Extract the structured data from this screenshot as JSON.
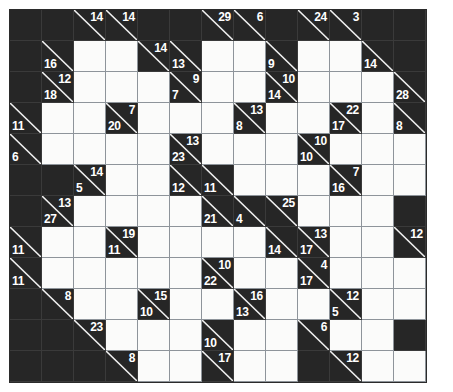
{
  "puzzle": {
    "type": "kakuro",
    "title": "Kakuro",
    "columns": 13,
    "rows": 12,
    "cell_size_px": 32,
    "colors": {
      "block": "#262626",
      "open": "#fbfbfa",
      "clue_text": "#ffffff",
      "slash": "#f2f2f2",
      "grid_line": "#8e949a",
      "page_background": "#ffffff"
    },
    "legend": {
      "down_position": "top-right",
      "across_position": "bottom-left"
    },
    "cells": [
      [
        {
          "t": "block"
        },
        {
          "t": "block"
        },
        {
          "t": "clue",
          "down": 14
        },
        {
          "t": "clue",
          "down": 14
        },
        {
          "t": "block"
        },
        {
          "t": "block"
        },
        {
          "t": "clue",
          "down": 29
        },
        {
          "t": "clue",
          "down": 6
        },
        {
          "t": "block"
        },
        {
          "t": "clue",
          "down": 24
        },
        {
          "t": "clue",
          "down": 3
        },
        {
          "t": "block"
        },
        {
          "t": "block"
        }
      ],
      [
        {
          "t": "block"
        },
        {
          "t": "clue",
          "across": 16
        },
        {
          "t": "open"
        },
        {
          "t": "open"
        },
        {
          "t": "clue",
          "down": 14
        },
        {
          "t": "clue",
          "across": 13
        },
        {
          "t": "open"
        },
        {
          "t": "open"
        },
        {
          "t": "clue",
          "across": 9
        },
        {
          "t": "open"
        },
        {
          "t": "open"
        },
        {
          "t": "clue",
          "across": 14
        },
        {
          "t": "block"
        }
      ],
      [
        {
          "t": "block"
        },
        {
          "t": "clue",
          "across": 18,
          "down": 12
        },
        {
          "t": "open"
        },
        {
          "t": "open"
        },
        {
          "t": "open"
        },
        {
          "t": "clue",
          "across": 7,
          "down": 9
        },
        {
          "t": "open"
        },
        {
          "t": "open"
        },
        {
          "t": "clue",
          "across": 14,
          "down": 10
        },
        {
          "t": "open"
        },
        {
          "t": "open"
        },
        {
          "t": "open"
        },
        {
          "t": "clue",
          "across": 28
        }
      ],
      [
        {
          "t": "clue",
          "across": 11
        },
        {
          "t": "open"
        },
        {
          "t": "open"
        },
        {
          "t": "clue",
          "across": 20,
          "down": 7
        },
        {
          "t": "open"
        },
        {
          "t": "open"
        },
        {
          "t": "open"
        },
        {
          "t": "clue",
          "across": 8,
          "down": 13
        },
        {
          "t": "open"
        },
        {
          "t": "open"
        },
        {
          "t": "clue",
          "across": 17,
          "down": 22
        },
        {
          "t": "open"
        },
        {
          "t": "clue",
          "across": 8
        }
      ],
      [
        {
          "t": "clue",
          "across": 6
        },
        {
          "t": "open"
        },
        {
          "t": "open"
        },
        {
          "t": "open"
        },
        {
          "t": "open"
        },
        {
          "t": "clue",
          "across": 23,
          "down": 13
        },
        {
          "t": "open"
        },
        {
          "t": "open"
        },
        {
          "t": "open"
        },
        {
          "t": "clue",
          "across": 10,
          "down": 10
        },
        {
          "t": "open"
        },
        {
          "t": "open"
        },
        {
          "t": "open"
        }
      ],
      [
        {
          "t": "block"
        },
        {
          "t": "block"
        },
        {
          "t": "clue",
          "across": 5,
          "down": 14
        },
        {
          "t": "open"
        },
        {
          "t": "open"
        },
        {
          "t": "clue",
          "across": 12
        },
        {
          "t": "clue",
          "across": 11
        },
        {
          "t": "open"
        },
        {
          "t": "open"
        },
        {
          "t": "open"
        },
        {
          "t": "clue",
          "across": 16,
          "down": 7
        },
        {
          "t": "open"
        },
        {
          "t": "open"
        }
      ],
      [
        {
          "t": "block"
        },
        {
          "t": "clue",
          "across": 27,
          "down": 13
        },
        {
          "t": "open"
        },
        {
          "t": "open"
        },
        {
          "t": "open"
        },
        {
          "t": "open"
        },
        {
          "t": "clue",
          "across": 21
        },
        {
          "t": "clue",
          "across": 4
        },
        {
          "t": "clue",
          "down": 25
        },
        {
          "t": "open"
        },
        {
          "t": "open"
        },
        {
          "t": "open"
        },
        {
          "t": "block"
        }
      ],
      [
        {
          "t": "clue",
          "across": 11
        },
        {
          "t": "open"
        },
        {
          "t": "open"
        },
        {
          "t": "clue",
          "across": 11,
          "down": 19
        },
        {
          "t": "open"
        },
        {
          "t": "open"
        },
        {
          "t": "open"
        },
        {
          "t": "open"
        },
        {
          "t": "clue",
          "across": 14
        },
        {
          "t": "clue",
          "across": 17,
          "down": 13
        },
        {
          "t": "open"
        },
        {
          "t": "open"
        },
        {
          "t": "clue",
          "down": 12
        },
        {
          "t": "clue",
          "down": 13
        }
      ],
      [
        {
          "t": "clue",
          "across": 11
        },
        {
          "t": "open"
        },
        {
          "t": "open"
        },
        {
          "t": "open"
        },
        {
          "t": "open"
        },
        {
          "t": "open"
        },
        {
          "t": "clue",
          "across": 22,
          "down": 10
        },
        {
          "t": "open"
        },
        {
          "t": "open"
        },
        {
          "t": "clue",
          "across": 17,
          "down": 4
        },
        {
          "t": "open"
        },
        {
          "t": "open"
        },
        {
          "t": "open"
        }
      ],
      [
        {
          "t": "block"
        },
        {
          "t": "clue",
          "down": 8
        },
        {
          "t": "open"
        },
        {
          "t": "open"
        },
        {
          "t": "clue",
          "across": 10,
          "down": 15
        },
        {
          "t": "open"
        },
        {
          "t": "open"
        },
        {
          "t": "clue",
          "across": 13,
          "down": 16
        },
        {
          "t": "open"
        },
        {
          "t": "open"
        },
        {
          "t": "clue",
          "across": 5,
          "down": 12
        },
        {
          "t": "open"
        },
        {
          "t": "open"
        }
      ],
      [
        {
          "t": "block"
        },
        {
          "t": "block"
        },
        {
          "t": "clue",
          "down": 23
        },
        {
          "t": "open"
        },
        {
          "t": "open"
        },
        {
          "t": "open"
        },
        {
          "t": "clue",
          "across": 10
        },
        {
          "t": "open"
        },
        {
          "t": "open"
        },
        {
          "t": "clue",
          "down": 6
        },
        {
          "t": "open"
        },
        {
          "t": "open"
        },
        {
          "t": "block"
        }
      ],
      [
        {
          "t": "block"
        },
        {
          "t": "block"
        },
        {
          "t": "block"
        },
        {
          "t": "clue",
          "down": 8
        },
        {
          "t": "open"
        },
        {
          "t": "open"
        },
        {
          "t": "clue",
          "down": 17
        },
        {
          "t": "open"
        },
        {
          "t": "open"
        },
        {
          "t": "block"
        },
        {
          "t": "clue",
          "down": 12
        },
        {
          "t": "open"
        },
        {
          "t": "open"
        },
        {
          "t": "block"
        }
      ]
    ]
  }
}
